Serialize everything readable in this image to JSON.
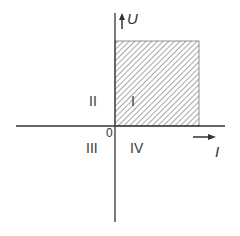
{
  "diagram": {
    "title": "",
    "axes": {
      "vertical_label": "U",
      "horizontal_label": "I",
      "origin_label": "0"
    },
    "quadrants": [
      {
        "id": "q1",
        "label": "I",
        "shaded": true
      },
      {
        "id": "q2",
        "label": "II",
        "shaded": false
      },
      {
        "id": "q3",
        "label": "III",
        "shaded": false
      },
      {
        "id": "q4",
        "label": "IV",
        "shaded": false
      }
    ],
    "colors": {
      "axis": "#333333",
      "hatch": "#6a6a6a",
      "text": "#333333",
      "background": "#ffffff"
    }
  }
}
